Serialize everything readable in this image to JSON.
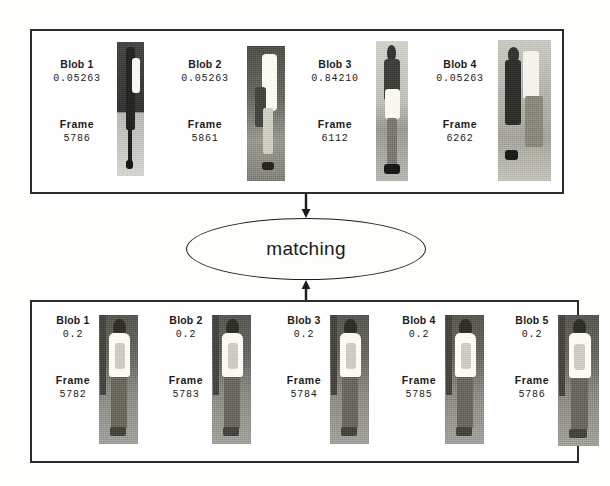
{
  "figure": {
    "ink_color": "#1e1e1e",
    "panel_border_color": "#2c2c2c",
    "background_color": "#ffffff"
  },
  "matching_node": {
    "label": "matching",
    "shape": "ellipse"
  },
  "arrows": {
    "into_node": "arrow-down-icon",
    "out_of_node": "arrow-up-icon"
  },
  "panels": [
    {
      "id": "top",
      "name": "candidate-track-panel",
      "blobs": [
        {
          "blob_label": "Blob 1",
          "score": "0.05263",
          "frame_label": "Frame",
          "frame_number": "5786",
          "thumbnail": "person-crop-dark-figure"
        },
        {
          "blob_label": "Blob 2",
          "score": "0.05263",
          "frame_label": "Frame",
          "frame_number": "5861",
          "thumbnail": "person-crop-white-shirt"
        },
        {
          "blob_label": "Blob 3",
          "score": "0.84210",
          "frame_label": "Frame",
          "frame_number": "6112",
          "thumbnail": "person-crop-standing-figure"
        },
        {
          "blob_label": "Blob 4",
          "score": "0.05263",
          "frame_label": "Frame",
          "frame_number": "6262",
          "thumbnail": "person-crop-two-figures"
        }
      ]
    },
    {
      "id": "bottom",
      "name": "query-track-panel",
      "blobs": [
        {
          "blob_label": "Blob 1",
          "score": "0.2",
          "frame_label": "Frame",
          "frame_number": "5782",
          "thumbnail": "person-crop-rear-view"
        },
        {
          "blob_label": "Blob 2",
          "score": "0.2",
          "frame_label": "Frame",
          "frame_number": "5783",
          "thumbnail": "person-crop-rear-view"
        },
        {
          "blob_label": "Blob 3",
          "score": "0.2",
          "frame_label": "Frame",
          "frame_number": "5784",
          "thumbnail": "person-crop-rear-view"
        },
        {
          "blob_label": "Blob 4",
          "score": "0.2",
          "frame_label": "Frame",
          "frame_number": "5785",
          "thumbnail": "person-crop-rear-view"
        },
        {
          "blob_label": "Blob 5",
          "score": "0.2",
          "frame_label": "Frame",
          "frame_number": "5786",
          "thumbnail": "person-crop-rear-view"
        }
      ]
    }
  ]
}
